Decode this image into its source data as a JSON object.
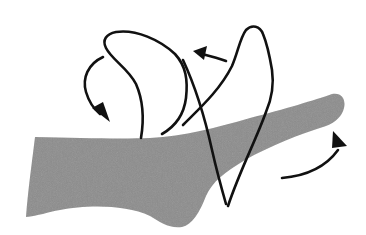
{
  "figure": {
    "description": "Figure-of-eight bandage wrapping around a foot and ankle, with directional arrows",
    "colors": {
      "background": "#ffffff",
      "foot_fill": "#8c8c8c",
      "line": "#111111"
    },
    "elements": {
      "foot": "foot-silhouette",
      "bandage_loops": "figure-eight-wrap",
      "arrows": [
        {
          "name": "arrow-down-left",
          "direction": "down"
        },
        {
          "name": "arrow-top-left",
          "direction": "left"
        },
        {
          "name": "arrow-up-right",
          "direction": "up"
        }
      ]
    }
  }
}
